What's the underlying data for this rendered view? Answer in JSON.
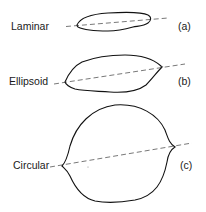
{
  "diagram": {
    "shapes": [
      {
        "id": "a",
        "name": "Laminar",
        "tag": "(a)"
      },
      {
        "id": "b",
        "name": "Ellipsoid",
        "tag": "(b)"
      },
      {
        "id": "c",
        "name": "Circular",
        "tag": "(c)"
      }
    ],
    "colors": {
      "stroke": "#111111",
      "axis": "#555555",
      "text": "#1a1a1a"
    }
  }
}
